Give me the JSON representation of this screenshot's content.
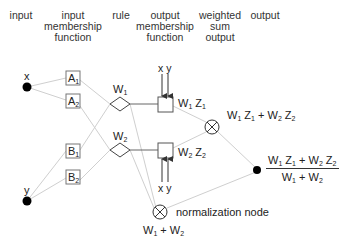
{
  "headers": {
    "input": "input",
    "input_mf": [
      "input",
      "membership",
      "function"
    ],
    "rule": "rule",
    "output_mf": [
      "output",
      "membership",
      "function"
    ],
    "weighted_sum": [
      "weighted",
      "sum",
      "output"
    ],
    "output": "output"
  },
  "inputs": {
    "x": "x",
    "y": "y"
  },
  "membership": {
    "A1": {
      "base": "A",
      "sub": "1"
    },
    "A2": {
      "base": "A",
      "sub": "2"
    },
    "B1": {
      "base": "B",
      "sub": "1"
    },
    "B2": {
      "base": "B",
      "sub": "2"
    }
  },
  "rules": {
    "W1": {
      "base": "W",
      "sub": "1"
    },
    "W2": {
      "base": "W",
      "sub": "2"
    }
  },
  "output_mf": {
    "top_inputs": "x y",
    "bottom_inputs": "x y",
    "z1_label": {
      "w": "W",
      "wsub": "1",
      "z": "Z",
      "zsub": "1"
    },
    "z2_label": {
      "w": "W",
      "wsub": "2",
      "z": "Z",
      "zsub": "2"
    }
  },
  "sum_node": {
    "label": "W1 Z1 + W2 Z2"
  },
  "normalization_node": {
    "caption": "normalization node",
    "label": "W1 + W2"
  },
  "final_output": {
    "numerator": "W1 Z1 + W2 Z2",
    "denominator": "W1 + W2"
  },
  "colors": {
    "line": "#c8c8c8",
    "stroke": "#555555",
    "node": "#000000"
  }
}
